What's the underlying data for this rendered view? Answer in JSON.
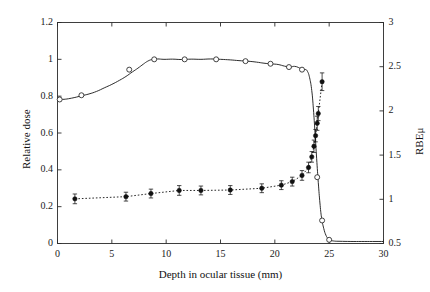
{
  "chart_data": {
    "type": "line",
    "title": "",
    "xlabel": "Depth in ocular tissue (mm)",
    "ylabel": "Relative dose",
    "y2label": "RBEμ",
    "xlim": [
      0,
      30
    ],
    "ylim": [
      0,
      1.2
    ],
    "y2lim": [
      0.5,
      3
    ],
    "grid": false,
    "legend": "none",
    "xticks": [
      "0",
      "5",
      "10",
      "15",
      "20",
      "25",
      "30"
    ],
    "xtick_values": [
      0,
      5,
      10,
      15,
      20,
      25,
      30
    ],
    "yticks": [
      "0",
      "0.2",
      "0.4",
      "0.6",
      "0.8",
      "1",
      "1.2"
    ],
    "ytick_values": [
      0,
      0.2,
      0.4,
      0.6,
      0.8,
      1,
      1.2
    ],
    "y2ticks": [
      "0.5",
      "1",
      "1.5",
      "2",
      "2.5",
      "3"
    ],
    "y2tick_values": [
      0.5,
      1,
      1.5,
      2,
      2.5,
      3
    ],
    "series": [
      {
        "name": "Relative dose (SOBP depth-dose)",
        "axis": "left",
        "style": "solid",
        "marker": "open-circle",
        "color": "#222222",
        "points": [
          {
            "x": 0.15,
            "y": 0.782
          },
          {
            "x": 0.6,
            "y": 0.783
          },
          {
            "x": 1.0,
            "y": 0.786
          },
          {
            "x": 1.6,
            "y": 0.793
          },
          {
            "x": 2.2,
            "y": 0.802
          },
          {
            "x": 2.9,
            "y": 0.812
          },
          {
            "x": 3.6,
            "y": 0.826
          },
          {
            "x": 4.3,
            "y": 0.845
          },
          {
            "x": 5.0,
            "y": 0.864
          },
          {
            "x": 5.7,
            "y": 0.886
          },
          {
            "x": 6.3,
            "y": 0.907
          },
          {
            "x": 6.9,
            "y": 0.932
          },
          {
            "x": 7.4,
            "y": 0.952
          },
          {
            "x": 7.9,
            "y": 0.974
          },
          {
            "x": 8.3,
            "y": 0.99
          },
          {
            "x": 8.7,
            "y": 0.999
          },
          {
            "x": 9.2,
            "y": 1.002
          },
          {
            "x": 9.8,
            "y": 1.0
          },
          {
            "x": 10.6,
            "y": 1.001
          },
          {
            "x": 11.4,
            "y": 0.999
          },
          {
            "x": 12.3,
            "y": 1.001
          },
          {
            "x": 13.2,
            "y": 1.0
          },
          {
            "x": 14.1,
            "y": 1.002
          },
          {
            "x": 15.0,
            "y": 1.0
          },
          {
            "x": 15.9,
            "y": 0.997
          },
          {
            "x": 16.7,
            "y": 0.993
          },
          {
            "x": 17.5,
            "y": 0.99
          },
          {
            "x": 18.3,
            "y": 0.985
          },
          {
            "x": 19.0,
            "y": 0.979
          },
          {
            "x": 19.7,
            "y": 0.975
          },
          {
            "x": 20.3,
            "y": 0.972
          },
          {
            "x": 20.9,
            "y": 0.963
          },
          {
            "x": 21.4,
            "y": 0.958
          },
          {
            "x": 21.8,
            "y": 0.962
          },
          {
            "x": 22.2,
            "y": 0.955
          },
          {
            "x": 22.5,
            "y": 0.944
          },
          {
            "x": 22.8,
            "y": 0.945
          },
          {
            "x": 23.0,
            "y": 0.935
          },
          {
            "x": 23.2,
            "y": 0.9
          },
          {
            "x": 23.4,
            "y": 0.83
          },
          {
            "x": 23.55,
            "y": 0.73
          },
          {
            "x": 23.7,
            "y": 0.6
          },
          {
            "x": 23.85,
            "y": 0.46
          },
          {
            "x": 24.0,
            "y": 0.33
          },
          {
            "x": 24.15,
            "y": 0.22
          },
          {
            "x": 24.3,
            "y": 0.14
          },
          {
            "x": 24.5,
            "y": 0.082
          },
          {
            "x": 24.7,
            "y": 0.045
          },
          {
            "x": 24.9,
            "y": 0.027
          },
          {
            "x": 25.1,
            "y": 0.018
          },
          {
            "x": 25.5,
            "y": 0.013
          },
          {
            "x": 26.0,
            "y": 0.012
          },
          {
            "x": 27.0,
            "y": 0.011
          },
          {
            "x": 28.0,
            "y": 0.011
          },
          {
            "x": 29.0,
            "y": 0.011
          },
          {
            "x": 30.0,
            "y": 0.011
          }
        ],
        "markers": [
          {
            "x": 0.2,
            "y": 0.782
          },
          {
            "x": 2.2,
            "y": 0.805
          },
          {
            "x": 6.6,
            "y": 0.944
          },
          {
            "x": 8.9,
            "y": 1.0
          },
          {
            "x": 11.7,
            "y": 1.0
          },
          {
            "x": 14.6,
            "y": 1.0
          },
          {
            "x": 17.3,
            "y": 0.99
          },
          {
            "x": 19.6,
            "y": 0.976
          },
          {
            "x": 21.3,
            "y": 0.958
          },
          {
            "x": 22.5,
            "y": 0.944
          },
          {
            "x": 23.9,
            "y": 0.36
          },
          {
            "x": 24.35,
            "y": 0.125
          },
          {
            "x": 25.0,
            "y": 0.02
          }
        ]
      },
      {
        "name": "RBEμ",
        "axis": "right",
        "style": "dotted",
        "marker": "filled-circle",
        "color": "#111111",
        "points": [
          {
            "x": 1.6,
            "y": 1.005,
            "err": 0.055
          },
          {
            "x": 6.3,
            "y": 1.03,
            "err": 0.05
          },
          {
            "x": 8.6,
            "y": 1.065,
            "err": 0.05
          },
          {
            "x": 11.2,
            "y": 1.1,
            "err": 0.055
          },
          {
            "x": 13.2,
            "y": 1.1,
            "err": 0.05
          },
          {
            "x": 15.9,
            "y": 1.105,
            "err": 0.05
          },
          {
            "x": 18.8,
            "y": 1.125,
            "err": 0.05
          },
          {
            "x": 20.6,
            "y": 1.16,
            "err": 0.05
          },
          {
            "x": 21.6,
            "y": 1.2,
            "err": 0.05
          },
          {
            "x": 22.5,
            "y": 1.27,
            "err": 0.055
          },
          {
            "x": 23.1,
            "y": 1.36,
            "err": 0.06
          },
          {
            "x": 23.4,
            "y": 1.48,
            "err": 0.06
          },
          {
            "x": 23.6,
            "y": 1.6,
            "err": 0.07
          },
          {
            "x": 23.75,
            "y": 1.72,
            "err": 0.07
          },
          {
            "x": 23.9,
            "y": 1.86,
            "err": 0.08
          },
          {
            "x": 24.0,
            "y": 1.97,
            "err": 0.08
          },
          {
            "x": 24.35,
            "y": 2.33,
            "err": 0.1
          }
        ]
      }
    ]
  }
}
